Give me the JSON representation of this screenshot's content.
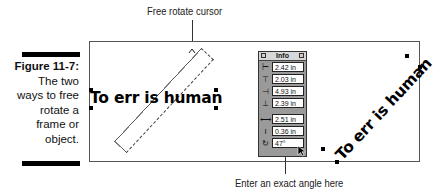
{
  "callouts": {
    "top": "Free rotate cursor",
    "bottom": "Enter an exact angle here"
  },
  "caption": {
    "figure": "Figure 11-7:",
    "lines": [
      "The two",
      "ways to free",
      "rotate a",
      "frame or",
      "object."
    ]
  },
  "canvas": {
    "original_text": "To err is human",
    "rotated_text": "To err is human"
  },
  "info_panel": {
    "title": "Info",
    "rows": [
      {
        "icon": "left-edge-icon",
        "glyph": "⊢",
        "value": "2.42 in"
      },
      {
        "icon": "top-edge-icon",
        "glyph": "⊤",
        "value": "2.03 in"
      },
      {
        "icon": "right-edge-icon",
        "glyph": "⊣",
        "value": "4.93 in"
      },
      {
        "icon": "bottom-edge-icon",
        "glyph": "⊥",
        "value": "2.39 in"
      },
      {
        "icon": "width-icon",
        "glyph": "⟷",
        "value": "2.51 in"
      },
      {
        "icon": "height-icon",
        "glyph": "I",
        "value": "0.36 in"
      },
      {
        "icon": "rotation-icon",
        "glyph": "↻",
        "value": "47°"
      }
    ]
  }
}
